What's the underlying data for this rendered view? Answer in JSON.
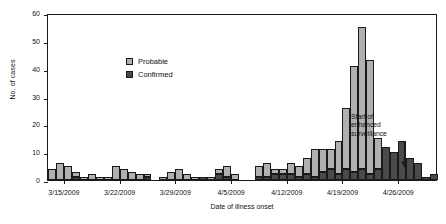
{
  "chart_data": {
    "type": "bar",
    "subtype": "stacked-histogram-epidemic-curve",
    "title": "",
    "xlabel": "Date of illness onset",
    "ylabel": "No. of cases",
    "ylim": [
      0,
      60
    ],
    "yticks": [
      0,
      10,
      20,
      30,
      40,
      50,
      60
    ],
    "ytick_labels": [
      "0",
      "10",
      "20",
      "30",
      "40",
      "50",
      "60"
    ],
    "grid": false,
    "legend_position": "upper-left-inside",
    "xtick_labels": [
      "3/15/2009",
      "3/22/2009",
      "3/29/2009",
      "4/5/2009",
      "4/12/2009",
      "4/19/2009",
      "4/26/2009"
    ],
    "xtick_dates": [
      "3/15/2009",
      "3/22/2009",
      "3/29/2009",
      "4/5/2009",
      "4/12/2009",
      "4/19/2009",
      "4/26/2009"
    ],
    "series": [
      {
        "name": "Confirmed",
        "color": "#4a4a4a",
        "values": [
          0,
          0,
          0,
          1,
          0,
          0,
          0,
          0,
          0,
          0,
          0,
          0,
          1,
          0,
          0,
          0,
          0,
          0,
          0,
          1,
          0,
          2,
          1,
          0,
          0,
          0,
          1,
          1,
          2,
          2,
          2,
          1,
          2,
          1,
          3,
          4,
          2,
          4,
          3,
          4,
          2,
          4,
          12,
          10,
          14,
          8,
          6,
          1,
          2
        ]
      },
      {
        "name": "Probable",
        "color": "#b0b0b0",
        "values": [
          4,
          6,
          5,
          2,
          1,
          2,
          1,
          1,
          5,
          4,
          3,
          2,
          1,
          0,
          1,
          3,
          4,
          2,
          1,
          0,
          1,
          2,
          4,
          2,
          0,
          0,
          4,
          5,
          2,
          2,
          4,
          4,
          6,
          10,
          8,
          7,
          12,
          22,
          38,
          51,
          41,
          11,
          0,
          0,
          0,
          0,
          0,
          0,
          0
        ]
      }
    ],
    "categories": [
      "3/13/2009",
      "3/14/2009",
      "3/15/2009",
      "3/16/2009",
      "3/17/2009",
      "3/18/2009",
      "3/19/2009",
      "3/20/2009",
      "3/21/2009",
      "3/22/2009",
      "3/23/2009",
      "3/24/2009",
      "3/25/2009",
      "3/26/2009",
      "3/27/2009",
      "3/28/2009",
      "3/29/2009",
      "3/30/2009",
      "3/31/2009",
      "4/1/2009",
      "4/2/2009",
      "4/3/2009",
      "4/4/2009",
      "4/5/2009",
      "4/6/2009",
      "4/7/2009",
      "4/8/2009",
      "4/9/2009",
      "4/10/2009",
      "4/11/2009",
      "4/12/2009",
      "4/13/2009",
      "4/14/2009",
      "4/15/2009",
      "4/16/2009",
      "4/17/2009",
      "4/18/2009",
      "4/19/2009",
      "4/20/2009",
      "4/21/2009",
      "4/22/2009",
      "4/23/2009",
      "4/24/2009",
      "4/25/2009",
      "4/26/2009",
      "4/27/2009",
      "4/28/2009",
      "4/29/2009",
      "4/30/2009"
    ],
    "totals": [
      4,
      6,
      6,
      3,
      1,
      2,
      1,
      1,
      5,
      4,
      3,
      2,
      2,
      0,
      1,
      3,
      4,
      2,
      1,
      1,
      1,
      4,
      5,
      2,
      0,
      0,
      5,
      6,
      4,
      4,
      6,
      5,
      8,
      11,
      11,
      11,
      14,
      26,
      41,
      55,
      43,
      15,
      12,
      10,
      14,
      8,
      6,
      1,
      2
    ],
    "annotations": [
      {
        "name": "start-of-enhanced-surveillance",
        "lines": [
          "Start of",
          "enhanced",
          "surveillance"
        ],
        "points_to_date": "4/17/2009",
        "arrow": "down"
      }
    ]
  },
  "legend": {
    "items": [
      {
        "label": "Probable",
        "color": "#b0b0b0"
      },
      {
        "label": "Confirmed",
        "color": "#4a4a4a"
      }
    ]
  },
  "colors": {
    "probable": "#b0b0b0",
    "confirmed": "#4a4a4a",
    "axis": "#1a1a1a",
    "background": "#ffffff"
  }
}
